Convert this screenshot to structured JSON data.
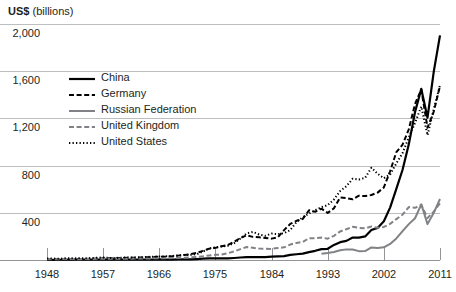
{
  "axis_title": {
    "bold": "US$",
    "unit": " (billions)"
  },
  "legend": {
    "entries": [
      {
        "label": "China",
        "style": "solid-black-thick",
        "color": "#000000"
      },
      {
        "label": "Germany",
        "style": "dashed-black",
        "color": "#000000"
      },
      {
        "label": "Russian Federation",
        "style": "solid-gray",
        "color": "#808285"
      },
      {
        "label": "United Kingdom",
        "style": "dashed-gray",
        "color": "#808285"
      },
      {
        "label": "United States",
        "style": "dotted-black",
        "color": "#000000"
      }
    ]
  },
  "chart_data": {
    "type": "line",
    "title": "US$ (billions)",
    "xlabel": "",
    "ylabel": "US$ (billions)",
    "xlim": [
      1948,
      2011
    ],
    "ylim": [
      0,
      2000
    ],
    "yticks": [
      400,
      800,
      1200,
      1600,
      2000
    ],
    "ytick_labels": [
      "400",
      "800",
      "1,200",
      "1,600",
      "2,000"
    ],
    "xticks": [
      1948,
      1957,
      1966,
      1975,
      1984,
      1993,
      2002,
      2011
    ],
    "xtick_labels": [
      "1948",
      "1957",
      "1966",
      "1975",
      "1984",
      "1993",
      "2002",
      "2011"
    ],
    "grid": "horizontal",
    "legend_position": "upper-left-inside",
    "x": [
      1948,
      1949,
      1950,
      1951,
      1952,
      1953,
      1954,
      1955,
      1956,
      1957,
      1958,
      1959,
      1960,
      1961,
      1962,
      1963,
      1964,
      1965,
      1966,
      1967,
      1968,
      1969,
      1970,
      1971,
      1972,
      1973,
      1974,
      1975,
      1976,
      1977,
      1978,
      1979,
      1980,
      1981,
      1982,
      1983,
      1984,
      1985,
      1986,
      1987,
      1988,
      1989,
      1990,
      1991,
      1992,
      1993,
      1994,
      1995,
      1996,
      1997,
      1998,
      1999,
      2000,
      2001,
      2002,
      2003,
      2004,
      2005,
      2006,
      2007,
      2008,
      2009,
      2010,
      2011
    ],
    "series": [
      {
        "name": "China",
        "style": "solid-black-thick",
        "color": "#000000",
        "values": [
          1,
          1,
          2,
          2,
          3,
          3,
          3,
          3,
          4,
          4,
          4,
          5,
          4,
          3,
          3,
          3,
          3,
          4,
          5,
          4,
          4,
          5,
          6,
          6,
          8,
          11,
          13,
          14,
          14,
          14,
          17,
          21,
          24,
          25,
          24,
          25,
          29,
          31,
          33,
          43,
          49,
          54,
          67,
          78,
          92,
          95,
          128,
          151,
          162,
          190,
          190,
          200,
          254,
          272,
          328,
          444,
          602,
          765,
          980,
          1254,
          1450,
          1206,
          1596,
          1904
        ]
      },
      {
        "name": "Germany",
        "style": "dashed-black",
        "color": "#000000",
        "values": [
          2,
          3,
          4,
          6,
          7,
          8,
          9,
          11,
          13,
          14,
          14,
          15,
          17,
          19,
          20,
          21,
          23,
          25,
          27,
          28,
          31,
          37,
          42,
          49,
          60,
          77,
          96,
          103,
          116,
          128,
          155,
          186,
          210,
          196,
          192,
          186,
          181,
          192,
          253,
          306,
          332,
          348,
          421,
          409,
          435,
          399,
          438,
          531,
          525,
          514,
          545,
          542,
          551,
          571,
          615,
          752,
          914,
          977,
          1108,
          1323,
          1446,
          1121,
          1258,
          1474
        ]
      },
      {
        "name": "Russian Federation",
        "style": "solid-gray",
        "color": "#808285",
        "values": [
          null,
          null,
          null,
          null,
          null,
          null,
          null,
          null,
          null,
          null,
          null,
          null,
          null,
          null,
          null,
          null,
          null,
          null,
          null,
          null,
          null,
          null,
          null,
          null,
          null,
          null,
          null,
          null,
          null,
          null,
          null,
          null,
          null,
          null,
          null,
          null,
          null,
          null,
          null,
          null,
          null,
          null,
          null,
          null,
          54,
          59,
          68,
          82,
          90,
          89,
          75,
          76,
          106,
          102,
          107,
          136,
          183,
          244,
          304,
          354,
          472,
          304,
          400,
          517
        ]
      },
      {
        "name": "United Kingdom",
        "style": "dashed-gray",
        "color": "#808285",
        "values": [
          6,
          6,
          7,
          8,
          8,
          7,
          8,
          9,
          10,
          10,
          10,
          10,
          11,
          11,
          12,
          13,
          13,
          14,
          15,
          15,
          16,
          18,
          20,
          23,
          25,
          31,
          39,
          44,
          46,
          58,
          72,
          92,
          110,
          103,
          97,
          95,
          94,
          102,
          107,
          131,
          145,
          153,
          185,
          185,
          190,
          181,
          205,
          242,
          261,
          281,
          272,
          269,
          284,
          273,
          280,
          306,
          346,
          384,
          449,
          442,
          467,
          356,
          410,
          480
        ]
      },
      {
        "name": "United States",
        "style": "dotted-black",
        "color": "#000000",
        "values": [
          12,
          12,
          10,
          15,
          15,
          16,
          15,
          16,
          19,
          21,
          18,
          17,
          20,
          21,
          21,
          23,
          26,
          27,
          30,
          31,
          34,
          38,
          43,
          44,
          49,
          71,
          98,
          108,
          115,
          121,
          143,
          182,
          225,
          238,
          216,
          205,
          224,
          219,
          227,
          254,
          322,
          363,
          393,
          422,
          448,
          465,
          513,
          585,
          625,
          689,
          682,
          696,
          782,
          731,
          693,
          725,
          819,
          907,
          1038,
          1163,
          1301,
          1057,
          1278,
          1482
        ]
      }
    ]
  }
}
